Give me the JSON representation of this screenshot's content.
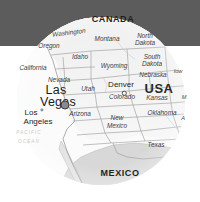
{
  "image": {
    "title": "Las Vegas location map",
    "width": 200,
    "height": 202
  },
  "colors": {
    "top_band": "#5c5c5c",
    "page_background": "#ffffff",
    "land_usa": "#f4f4f4",
    "land_mexico": "#d6d6d6",
    "border_line": "#8d8d8d",
    "marker_major": "#8a8a8a",
    "marker_outline": "#3a3a3a",
    "text": "#2f2f2f"
  },
  "map": {
    "shape": "circle",
    "center_x": 101,
    "center_y": 101,
    "diameter": 168,
    "countries": [
      {
        "name": "CANADA",
        "x": 113,
        "y": 20
      },
      {
        "name": "USA",
        "x": 159,
        "y": 89
      },
      {
        "name": "MEXICO",
        "x": 120,
        "y": 174
      }
    ],
    "states": [
      {
        "name": "Washington",
        "x": 69,
        "y": 33,
        "size": "state"
      },
      {
        "name": "Oregon",
        "x": 49,
        "y": 46,
        "size": "state"
      },
      {
        "name": "Idaho",
        "x": 80,
        "y": 57,
        "size": "state"
      },
      {
        "name": "Montana",
        "x": 107,
        "y": 39,
        "size": "state"
      },
      {
        "name": "North",
        "x": 145,
        "y": 36,
        "size": "state"
      },
      {
        "name": "Dakota",
        "x": 145,
        "y": 43,
        "size": "state"
      },
      {
        "name": "South",
        "x": 152,
        "y": 57,
        "size": "state"
      },
      {
        "name": "Dakota",
        "x": 152,
        "y": 64,
        "size": "state"
      },
      {
        "name": "Wyoming",
        "x": 114,
        "y": 66,
        "size": "state"
      },
      {
        "name": "Nebraska",
        "x": 153,
        "y": 75,
        "size": "state"
      },
      {
        "name": "Iow",
        "x": 178,
        "y": 72,
        "size": "state-sm"
      },
      {
        "name": "California",
        "x": 33,
        "y": 68,
        "size": "state"
      },
      {
        "name": "Nevada",
        "x": 59,
        "y": 80,
        "size": "state"
      },
      {
        "name": "Utah",
        "x": 88,
        "y": 89,
        "size": "state"
      },
      {
        "name": "Colorado",
        "x": 122,
        "y": 97,
        "size": "state"
      },
      {
        "name": "Kansas",
        "x": 157,
        "y": 98,
        "size": "state"
      },
      {
        "name": "M",
        "x": 184,
        "y": 98,
        "size": "state-sm"
      },
      {
        "name": "Arizona",
        "x": 80,
        "y": 114,
        "size": "state"
      },
      {
        "name": "New",
        "x": 117,
        "y": 118,
        "size": "state"
      },
      {
        "name": "Mexico",
        "x": 117,
        "y": 126,
        "size": "state"
      },
      {
        "name": "Oklahoma",
        "x": 162,
        "y": 113,
        "size": "state"
      },
      {
        "name": "A",
        "x": 183,
        "y": 119,
        "size": "state-sm"
      },
      {
        "name": "Texas",
        "x": 156,
        "y": 145,
        "size": "state"
      }
    ],
    "cities": [
      {
        "name": "Las",
        "x": 56,
        "y": 90,
        "class": "city-major"
      },
      {
        "name": "Vegas",
        "x": 58,
        "y": 102,
        "class": "city-major"
      },
      {
        "name": "Denver",
        "x": 121,
        "y": 85,
        "class": "city-mid"
      },
      {
        "name": "Los",
        "x": 31,
        "y": 113,
        "class": "city-mid"
      },
      {
        "name": "Angeles",
        "x": 38,
        "y": 122,
        "class": "city-mid"
      }
    ],
    "markers": [
      {
        "label": "Las Vegas marker",
        "x": 65,
        "y": 105,
        "kind": "major"
      },
      {
        "label": "Denver marker",
        "x": 124,
        "y": 93,
        "kind": "mid"
      },
      {
        "label": "Los Angeles marker",
        "x": 42,
        "y": 110,
        "kind": "small"
      }
    ],
    "ocean": [
      {
        "name": "PACIFIC",
        "x": 29,
        "y": 133
      },
      {
        "name": "OCEAN",
        "x": 29,
        "y": 142
      }
    ]
  }
}
